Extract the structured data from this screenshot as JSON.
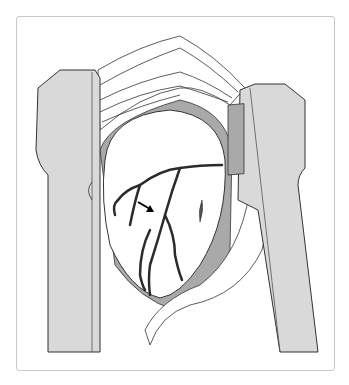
{
  "figure": {
    "colors": {
      "retractor_fill": "#d9d9d9",
      "outline": "#333333",
      "heart_fill": "#ffffff",
      "shadow_fill": "#a9a9a9",
      "vessel": "#2b2b2b",
      "frame_border": "#c8c8c8"
    },
    "annotations": [
      {
        "type": "arrow",
        "target": "coronary-vessel"
      }
    ]
  }
}
